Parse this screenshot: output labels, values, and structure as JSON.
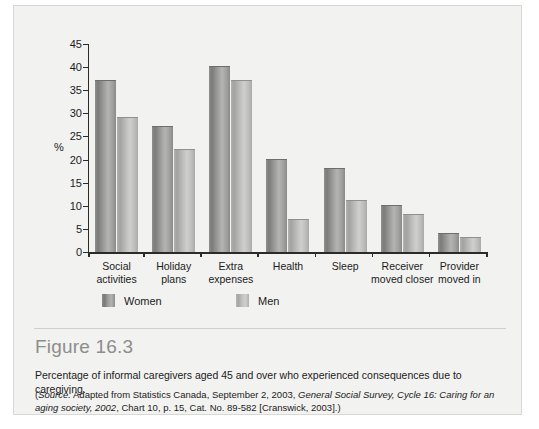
{
  "figure": {
    "title": "Figure 16.3",
    "description": "Percentage of informal caregivers aged 45 and over who experienced consequences due to caregiving.",
    "source": {
      "open_paren": "(",
      "source_label": "Source:",
      "part1": " Adapted from Statistics Canada, September 2, 2003, ",
      "italic1": "General Social Survey, Cycle 16: Caring for an aging society, 2002",
      "part2": ", Chart 10, p. 15, Cat. No. 89-582 [Cranswick, 2003].)"
    }
  },
  "legend": {
    "items": [
      {
        "label": "Women",
        "color": "#8b8b89"
      },
      {
        "label": "Men",
        "color": "#bdbdbb"
      }
    ]
  },
  "chart_data": {
    "type": "bar",
    "title": "",
    "xlabel": "",
    "ylabel": "%",
    "ylim": [
      0,
      45
    ],
    "yticks": [
      0,
      5,
      10,
      15,
      20,
      25,
      30,
      35,
      40,
      45
    ],
    "grid": false,
    "legend_position": "bottom-left",
    "categories": [
      "Social\nactivities",
      "Holiday\nplans",
      "Extra\nexpenses",
      "Health",
      "Sleep",
      "Receiver\nmoved closer",
      "Provider\nmoved in"
    ],
    "series": [
      {
        "name": "Women",
        "color": "#8b8b89",
        "values": [
          37,
          27,
          40,
          20,
          18,
          10,
          4
        ]
      },
      {
        "name": "Men",
        "color": "#bdbdbb",
        "values": [
          29,
          22,
          37,
          7,
          11,
          8,
          3
        ]
      }
    ]
  }
}
